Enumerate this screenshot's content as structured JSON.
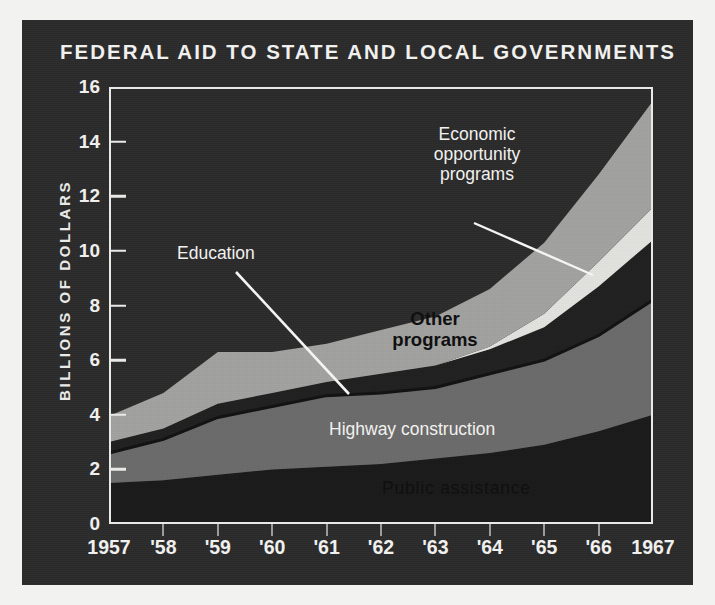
{
  "page": {
    "background_color": "#f2f2f0",
    "panel_color": "#2b2b2b"
  },
  "chart": {
    "title": "FEDERAL AID TO STATE AND LOCAL GOVERNMENTS",
    "ylabel": "BILLIONS OF DOLLARS"
  },
  "annotations": {
    "economic": "Economic\nopportunity\nprograms",
    "education": "Education",
    "other": "Other\nprograms",
    "highway": "Highway construction",
    "public": "Public assistance"
  },
  "chart_data": {
    "type": "area",
    "title": "FEDERAL AID TO STATE AND LOCAL GOVERNMENTS",
    "xlabel": "",
    "ylabel": "BILLIONS OF DOLLARS",
    "ylim": [
      0,
      16
    ],
    "yticks": [
      0,
      2,
      4,
      6,
      8,
      10,
      12,
      14,
      16
    ],
    "ytick_labels": [
      "0",
      "2",
      "4",
      "6",
      "8",
      "10",
      "12",
      "14",
      "16"
    ],
    "grid": false,
    "legend": "inline-annotations",
    "stacked": true,
    "categories": [
      "1957",
      "'58",
      "'59",
      "'60",
      "'61",
      "'62",
      "'63",
      "'64",
      "'65",
      "'66",
      "1967"
    ],
    "x_values": [
      1957,
      1958,
      1959,
      1960,
      1961,
      1962,
      1963,
      1964,
      1965,
      1966,
      1967
    ],
    "series": [
      {
        "name": "Public assistance",
        "color": "#191919",
        "label_color": "#101010",
        "values": [
          1.5,
          1.6,
          1.8,
          2.0,
          2.1,
          2.2,
          2.4,
          2.6,
          2.9,
          3.4,
          4.0
        ]
      },
      {
        "name": "Highway construction",
        "color": "#6b6b6b",
        "label_color": "#f1f1ef",
        "values": [
          1.1,
          1.5,
          2.1,
          2.3,
          2.6,
          2.6,
          2.6,
          2.9,
          3.1,
          3.5,
          4.2
        ]
      },
      {
        "name": "Education",
        "color": "#1f1f1f",
        "label_color": "#f1f1ef",
        "values": [
          0.4,
          0.4,
          0.5,
          0.5,
          0.5,
          0.7,
          0.8,
          0.9,
          1.2,
          1.8,
          2.2
        ]
      },
      {
        "name": "Economic opportunity programs",
        "color": "#e2e2de",
        "label_color": "#f1f1ef",
        "values": [
          0.0,
          0.0,
          0.0,
          0.0,
          0.0,
          0.0,
          0.0,
          0.1,
          0.5,
          0.9,
          1.2
        ]
      },
      {
        "name": "Other programs",
        "color": "#a2a2a0",
        "label_color": "#101010",
        "values": [
          0.95,
          1.3,
          1.9,
          1.5,
          1.4,
          1.6,
          1.8,
          2.1,
          2.6,
          3.2,
          3.9
        ]
      }
    ],
    "cumulative_tops": {
      "public_assistance": [
        1.5,
        1.6,
        1.8,
        2.0,
        2.1,
        2.2,
        2.4,
        2.6,
        2.9,
        3.4,
        4.0
      ],
      "highway": [
        2.6,
        3.1,
        3.9,
        4.3,
        4.7,
        4.8,
        5.0,
        5.5,
        6.0,
        6.9,
        8.2
      ],
      "education": [
        3.0,
        3.5,
        4.4,
        4.8,
        5.2,
        5.5,
        5.8,
        6.4,
        7.2,
        8.7,
        10.4
      ],
      "economic_opportunity": [
        3.0,
        3.5,
        4.4,
        4.8,
        5.2,
        5.5,
        5.8,
        6.5,
        7.7,
        9.6,
        11.6
      ],
      "total": [
        3.95,
        4.8,
        6.3,
        6.3,
        6.6,
        7.1,
        7.6,
        8.6,
        10.3,
        12.8,
        15.5
      ]
    }
  }
}
